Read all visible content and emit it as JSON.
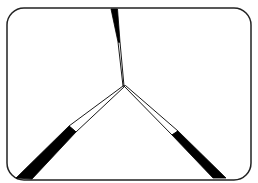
{
  "diagram": {
    "type": "three-wedge-junction",
    "canvas": {
      "width": 258,
      "height": 183,
      "background": "#ffffff"
    },
    "frame": {
      "x": 7,
      "y": 8,
      "width": 244,
      "height": 172,
      "radius": 17,
      "stroke": "#222222",
      "stroke_width": 1.5
    },
    "junction": {
      "x": 124,
      "y": 86
    },
    "colors": {
      "ink": "#000000",
      "fill_light": "#ffffff"
    },
    "wedges": [
      {
        "id": "top",
        "solid": "111,9 117.5,9 120,42 118,42",
        "hollow": "118,42 120,42 124,86 123,86"
      },
      {
        "id": "bottom-left",
        "solid": "69,126 76,132 32,179 16,178",
        "hollow": "69,126 76,132 124.5,86.5 123,86"
      },
      {
        "id": "bottom-right",
        "solid": "172,135 178,131 226,178 213,178",
        "hollow": "124,86 125.5,85.5 178,131 172,135"
      }
    ]
  }
}
